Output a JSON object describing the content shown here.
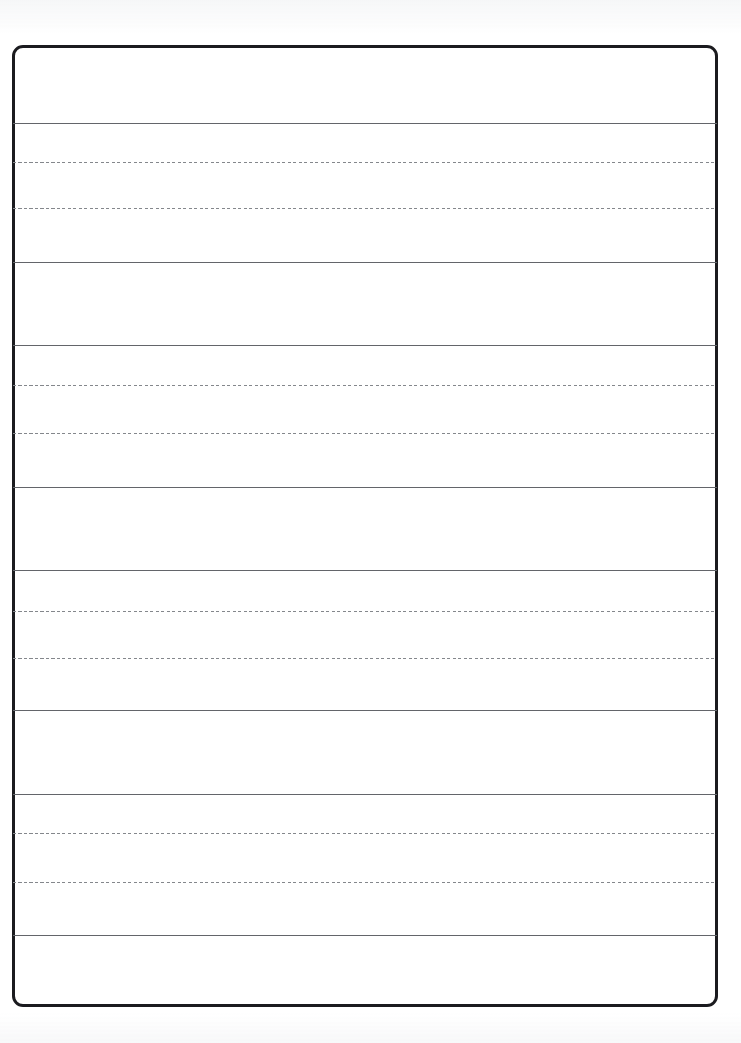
{
  "document": {
    "type": "handwriting-practice-worksheet",
    "title": "",
    "content_text": "",
    "page_width": 741,
    "page_height": 1043,
    "background_color": "#ffffff"
  },
  "frame": {
    "name": "worksheet-border",
    "x": 12,
    "y": 45,
    "width": 706,
    "height": 962,
    "border_color": "#1b1b1f",
    "border_width": 3,
    "corner_radius": 11
  },
  "style": {
    "solid_line_color": "#63656a",
    "dashed_line_color": "#84878c",
    "line_left": 13,
    "line_width": 704
  },
  "rules": {
    "solid_line_label": "solid baseline",
    "dashed_line_label": "dashed midline",
    "lines": [
      {
        "id": "line-1",
        "kind": "solid",
        "y": 123
      },
      {
        "id": "line-2",
        "kind": "dashed",
        "y": 162
      },
      {
        "id": "line-3",
        "kind": "dashed",
        "y": 208
      },
      {
        "id": "line-4",
        "kind": "solid",
        "y": 262
      },
      {
        "id": "line-5",
        "kind": "solid",
        "y": 345
      },
      {
        "id": "line-6",
        "kind": "dashed",
        "y": 385
      },
      {
        "id": "line-7",
        "kind": "dashed",
        "y": 433
      },
      {
        "id": "line-8",
        "kind": "solid",
        "y": 487
      },
      {
        "id": "line-9",
        "kind": "solid",
        "y": 570
      },
      {
        "id": "line-10",
        "kind": "dashed",
        "y": 611
      },
      {
        "id": "line-11",
        "kind": "dashed",
        "y": 658
      },
      {
        "id": "line-12",
        "kind": "solid",
        "y": 710
      },
      {
        "id": "line-13",
        "kind": "solid",
        "y": 794
      },
      {
        "id": "line-14",
        "kind": "dashed",
        "y": 833
      },
      {
        "id": "line-15",
        "kind": "dashed",
        "y": 882
      },
      {
        "id": "line-16",
        "kind": "solid",
        "y": 935
      }
    ]
  },
  "bands": {
    "writing_row_label": "writing row",
    "blank_band_label": "blank band",
    "items": [
      {
        "id": "band-top",
        "kind": "blank",
        "top": 48,
        "height": 75,
        "text": ""
      },
      {
        "id": "writing-row-1",
        "kind": "writing",
        "top": 123,
        "height": 139,
        "text": ""
      },
      {
        "id": "band-2",
        "kind": "blank",
        "top": 262,
        "height": 83,
        "text": ""
      },
      {
        "id": "writing-row-2",
        "kind": "writing",
        "top": 345,
        "height": 142,
        "text": ""
      },
      {
        "id": "band-3",
        "kind": "blank",
        "top": 487,
        "height": 83,
        "text": ""
      },
      {
        "id": "writing-row-3",
        "kind": "writing",
        "top": 570,
        "height": 140,
        "text": ""
      },
      {
        "id": "band-4",
        "kind": "blank",
        "top": 710,
        "height": 84,
        "text": ""
      },
      {
        "id": "writing-row-4",
        "kind": "writing",
        "top": 794,
        "height": 141,
        "text": ""
      },
      {
        "id": "band-bottom",
        "kind": "blank",
        "top": 935,
        "height": 69,
        "text": ""
      }
    ]
  }
}
